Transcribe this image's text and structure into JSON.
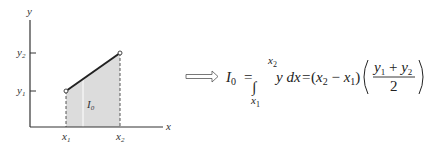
{
  "diagram": {
    "axes": {
      "x_label": "x",
      "y_label": "y"
    },
    "ticks": {
      "x1": {
        "base": "x",
        "sub": "1"
      },
      "x2": {
        "base": "x",
        "sub": "2"
      },
      "y1": {
        "base": "y",
        "sub": "1"
      },
      "y2": {
        "base": "y",
        "sub": "2"
      }
    },
    "area_label": {
      "base": "I",
      "sub": "0"
    },
    "colors": {
      "fill": "#d9d9d9",
      "line": "#222222",
      "axis": "#333333"
    }
  },
  "formula": {
    "lhs_base": "I",
    "lhs_sub": "0",
    "eq": "=",
    "integral": "∫",
    "upper": {
      "base": "x",
      "sub": "2"
    },
    "lower": {
      "base": "x",
      "sub": "1"
    },
    "integrand": "y dx",
    "eq2": "=",
    "diff": {
      "open": "(",
      "a": "x",
      "a_sub": "2",
      "minus": " − ",
      "b": "x",
      "b_sub": "1",
      "close": ")"
    },
    "frac": {
      "num_a": "y",
      "num_a_sub": "1",
      "plus": " + ",
      "num_b": "y",
      "num_b_sub": "2",
      "den": "2"
    }
  }
}
